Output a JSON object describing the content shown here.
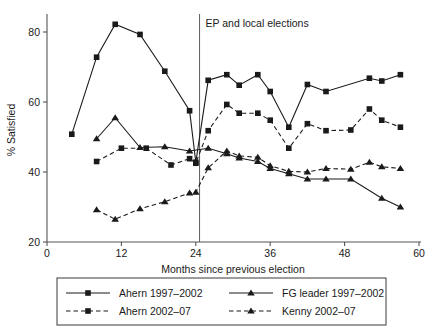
{
  "chart_data": {
    "type": "line",
    "title": "",
    "xlabel": "Months since previous election",
    "ylabel": "% Satisfied",
    "xlim": [
      0,
      60
    ],
    "ylim": [
      20,
      84
    ],
    "xticks": [
      0,
      12,
      24,
      36,
      48,
      60
    ],
    "yticks": [
      20,
      40,
      60,
      80
    ],
    "grid": false,
    "legend_position": "below",
    "annotations": [
      {
        "text": "EP and local elections",
        "x": 24.6,
        "type": "vertical-line-label"
      }
    ],
    "event_line_x": 24.6,
    "series": [
      {
        "name": "Ahern 1997–2002",
        "marker": "square",
        "linestyle": "solid",
        "color": "#1a1a1a",
        "points": [
          [
            4,
            50.8
          ],
          [
            8,
            72.8
          ],
          [
            11,
            82.2
          ],
          [
            15,
            79.3
          ],
          [
            19,
            68.8
          ],
          [
            23,
            57.5
          ],
          [
            24,
            42.8
          ],
          [
            26,
            66.2
          ],
          [
            29,
            67.8
          ],
          [
            31,
            64.8
          ],
          [
            34,
            67.8
          ],
          [
            36,
            63.0
          ],
          [
            39,
            52.8
          ],
          [
            42,
            65.0
          ],
          [
            45,
            63.0
          ],
          [
            52,
            66.8
          ],
          [
            54,
            66.0
          ],
          [
            57,
            67.8
          ]
        ]
      },
      {
        "name": "Ahern 2002–07",
        "marker": "square",
        "linestyle": "dashed",
        "color": "#1a1a1a",
        "points": [
          [
            8,
            43.0
          ],
          [
            12,
            46.8
          ],
          [
            16,
            46.8
          ],
          [
            20,
            42.0
          ],
          [
            23,
            43.8
          ],
          [
            24,
            42.5
          ],
          [
            26,
            51.8
          ],
          [
            29,
            59.3
          ],
          [
            31,
            56.8
          ],
          [
            34,
            56.8
          ],
          [
            36,
            54.8
          ],
          [
            39,
            46.8
          ],
          [
            42,
            53.8
          ],
          [
            45,
            51.8
          ],
          [
            49,
            52.0
          ],
          [
            52,
            58.0
          ],
          [
            54,
            54.8
          ],
          [
            57,
            52.8
          ]
        ]
      },
      {
        "name": "FG leader 1997–2002",
        "marker": "triangle",
        "linestyle": "solid",
        "color": "#1a1a1a",
        "points": [
          [
            8,
            49.5
          ],
          [
            11,
            55.5
          ],
          [
            15,
            47.0
          ],
          [
            19,
            47.2
          ],
          [
            23,
            46.0
          ],
          [
            26,
            46.8
          ],
          [
            29,
            45.2
          ],
          [
            31,
            44.0
          ],
          [
            34,
            43.0
          ],
          [
            36,
            41.0
          ],
          [
            39,
            39.5
          ],
          [
            42,
            38.0
          ],
          [
            45,
            38.0
          ],
          [
            49,
            38.0
          ],
          [
            54,
            32.5
          ],
          [
            57,
            30.0
          ]
        ]
      },
      {
        "name": "Kenny 2002–07",
        "marker": "triangle",
        "linestyle": "dashed",
        "color": "#1a1a1a",
        "points": [
          [
            8,
            29.2
          ],
          [
            11,
            26.5
          ],
          [
            15,
            29.5
          ],
          [
            19,
            31.5
          ],
          [
            23,
            34.0
          ],
          [
            24,
            34.2
          ],
          [
            26,
            41.2
          ],
          [
            29,
            46.0
          ],
          [
            31,
            44.6
          ],
          [
            34,
            44.2
          ],
          [
            36,
            41.8
          ],
          [
            39,
            40.2
          ],
          [
            42,
            40.0
          ],
          [
            45,
            41.0
          ],
          [
            49,
            40.8
          ],
          [
            52,
            42.8
          ],
          [
            54,
            41.5
          ],
          [
            57,
            41.0
          ]
        ]
      }
    ]
  },
  "legend": {
    "entries": [
      {
        "label": "Ahern 1997–2002",
        "marker": "square",
        "linestyle": "solid"
      },
      {
        "label": "FG leader 1997–2002",
        "marker": "triangle",
        "linestyle": "solid"
      },
      {
        "label": "Ahern 2002–07",
        "marker": "square",
        "linestyle": "dashed"
      },
      {
        "label": "Kenny 2002–07",
        "marker": "triangle",
        "linestyle": "dashed"
      }
    ]
  }
}
